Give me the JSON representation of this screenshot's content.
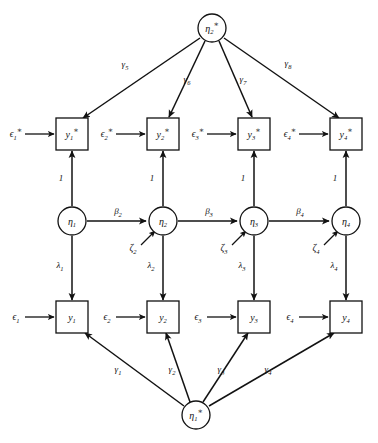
{
  "figure": {
    "type": "path-diagram",
    "background_color": "#ffffff",
    "line_color": "#121212",
    "width": 378,
    "height": 443
  },
  "nodes": {
    "top_latent": {
      "id": "eta2star",
      "base": "η",
      "sub": "2",
      "sup": "∗",
      "shape": "circle",
      "cx": 212,
      "cy": 28,
      "r": 14
    },
    "bottom_latent": {
      "id": "eta1star",
      "base": "η",
      "sub": "1",
      "sup": "∗",
      "shape": "circle",
      "cx": 196,
      "cy": 415,
      "r": 14
    },
    "top_indicators": [
      {
        "id": "y1star",
        "base": "y",
        "sub": "1",
        "sup": "∗",
        "shape": "box",
        "cx": 72,
        "cy": 134
      },
      {
        "id": "y2star",
        "base": "y",
        "sub": "2",
        "sup": "∗",
        "shape": "box",
        "cx": 163,
        "cy": 134
      },
      {
        "id": "y3star",
        "base": "y",
        "sub": "3",
        "sup": "∗",
        "shape": "box",
        "cx": 254,
        "cy": 134
      },
      {
        "id": "y4star",
        "base": "y",
        "sub": "4",
        "sup": "∗",
        "shape": "box",
        "cx": 346,
        "cy": 134
      }
    ],
    "middle_latents": [
      {
        "id": "eta1",
        "base": "η",
        "sub": "1",
        "sup": "",
        "shape": "circle",
        "cx": 72,
        "cy": 221,
        "r": 14
      },
      {
        "id": "eta2",
        "base": "η",
        "sub": "2",
        "sup": "",
        "shape": "circle",
        "cx": 163,
        "cy": 221,
        "r": 14
      },
      {
        "id": "eta3",
        "base": "η",
        "sub": "3",
        "sup": "",
        "shape": "circle",
        "cx": 254,
        "cy": 221,
        "r": 14
      },
      {
        "id": "eta4",
        "base": "η",
        "sub": "4",
        "sup": "",
        "shape": "circle",
        "cx": 346,
        "cy": 221,
        "r": 14
      }
    ],
    "bottom_indicators": [
      {
        "id": "y1",
        "base": "y",
        "sub": "1",
        "sup": "",
        "shape": "box",
        "cx": 72,
        "cy": 317
      },
      {
        "id": "y2",
        "base": "y",
        "sub": "2",
        "sup": "",
        "shape": "box",
        "cx": 163,
        "cy": 317
      },
      {
        "id": "y3",
        "base": "y",
        "sub": "3",
        "sup": "",
        "shape": "box",
        "cx": 254,
        "cy": 317
      },
      {
        "id": "y4",
        "base": "y",
        "sub": "4",
        "sup": "",
        "shape": "box",
        "cx": 346,
        "cy": 317
      }
    ]
  },
  "residuals": {
    "top_errors": [
      {
        "id": "eps1star",
        "base": "ϵ",
        "sub": "1",
        "sup": "∗",
        "x": 16,
        "y": 134
      },
      {
        "id": "eps2star",
        "base": "ϵ",
        "sub": "2",
        "sup": "∗",
        "x": 107,
        "y": 134
      },
      {
        "id": "eps3star",
        "base": "ϵ",
        "sub": "3",
        "sup": "∗",
        "x": 198,
        "y": 134
      },
      {
        "id": "eps4star",
        "base": "ϵ",
        "sub": "4",
        "sup": "∗",
        "x": 290,
        "y": 134
      }
    ],
    "bottom_errors": [
      {
        "id": "eps1",
        "base": "ϵ",
        "sub": "1",
        "sup": "",
        "x": 16,
        "y": 317
      },
      {
        "id": "eps2",
        "base": "ϵ",
        "sub": "2",
        "sup": "",
        "x": 107,
        "y": 317
      },
      {
        "id": "eps3",
        "base": "ϵ",
        "sub": "3",
        "sup": "",
        "x": 198,
        "y": 317
      },
      {
        "id": "eps4",
        "base": "ϵ",
        "sub": "4",
        "sup": "",
        "x": 290,
        "y": 317
      }
    ],
    "disturbances": [
      {
        "id": "zeta2",
        "base": "ζ",
        "sub": "2",
        "sup": "",
        "x": 133,
        "y": 248
      },
      {
        "id": "zeta3",
        "base": "ζ",
        "sub": "3",
        "sup": "",
        "x": 224,
        "y": 248
      },
      {
        "id": "zeta4",
        "base": "ζ",
        "sub": "4",
        "sup": "",
        "x": 316,
        "y": 248
      }
    ]
  },
  "edge_labels": {
    "gamma_bottom": [
      {
        "id": "gamma1",
        "base": "γ",
        "sub": "1",
        "x": 118,
        "y": 369
      },
      {
        "id": "gamma2",
        "base": "γ",
        "sub": "2",
        "x": 172,
        "y": 369
      },
      {
        "id": "gamma3",
        "base": "γ",
        "sub": "3",
        "x": 221,
        "y": 369
      },
      {
        "id": "gamma4",
        "base": "γ",
        "sub": "4",
        "x": 268,
        "y": 369
      }
    ],
    "gamma_top": [
      {
        "id": "gamma5",
        "base": "γ",
        "sub": "5",
        "x": 125,
        "y": 64
      },
      {
        "id": "gamma6",
        "base": "γ",
        "sub": "6",
        "x": 187,
        "y": 79
      },
      {
        "id": "gamma7",
        "base": "γ",
        "sub": "7",
        "x": 243,
        "y": 79
      },
      {
        "id": "gamma8",
        "base": "γ",
        "sub": "8",
        "x": 288,
        "y": 63
      }
    ],
    "beta": [
      {
        "id": "beta2",
        "base": "β",
        "sub": "2",
        "x": 118,
        "y": 211
      },
      {
        "id": "beta3",
        "base": "β",
        "sub": "3",
        "x": 209,
        "y": 211
      },
      {
        "id": "beta4",
        "base": "β",
        "sub": "4",
        "x": 300,
        "y": 211
      }
    ],
    "lambda": [
      {
        "id": "lambda1",
        "base": "λ",
        "sub": "1",
        "x": 60,
        "y": 265
      },
      {
        "id": "lambda2",
        "base": "λ",
        "sub": "2",
        "x": 151,
        "y": 265
      },
      {
        "id": "lambda3",
        "base": "λ",
        "sub": "3",
        "x": 242,
        "y": 265
      },
      {
        "id": "lambda4",
        "base": "λ",
        "sub": "4",
        "x": 334,
        "y": 265
      }
    ],
    "unit_loadings": [
      {
        "id": "unit1",
        "text": "1",
        "x": 61,
        "y": 178
      },
      {
        "id": "unit2",
        "text": "1",
        "x": 152,
        "y": 178
      },
      {
        "id": "unit3",
        "text": "1",
        "x": 243,
        "y": 178
      },
      {
        "id": "unit4",
        "text": "1",
        "x": 335,
        "y": 178
      }
    ]
  }
}
